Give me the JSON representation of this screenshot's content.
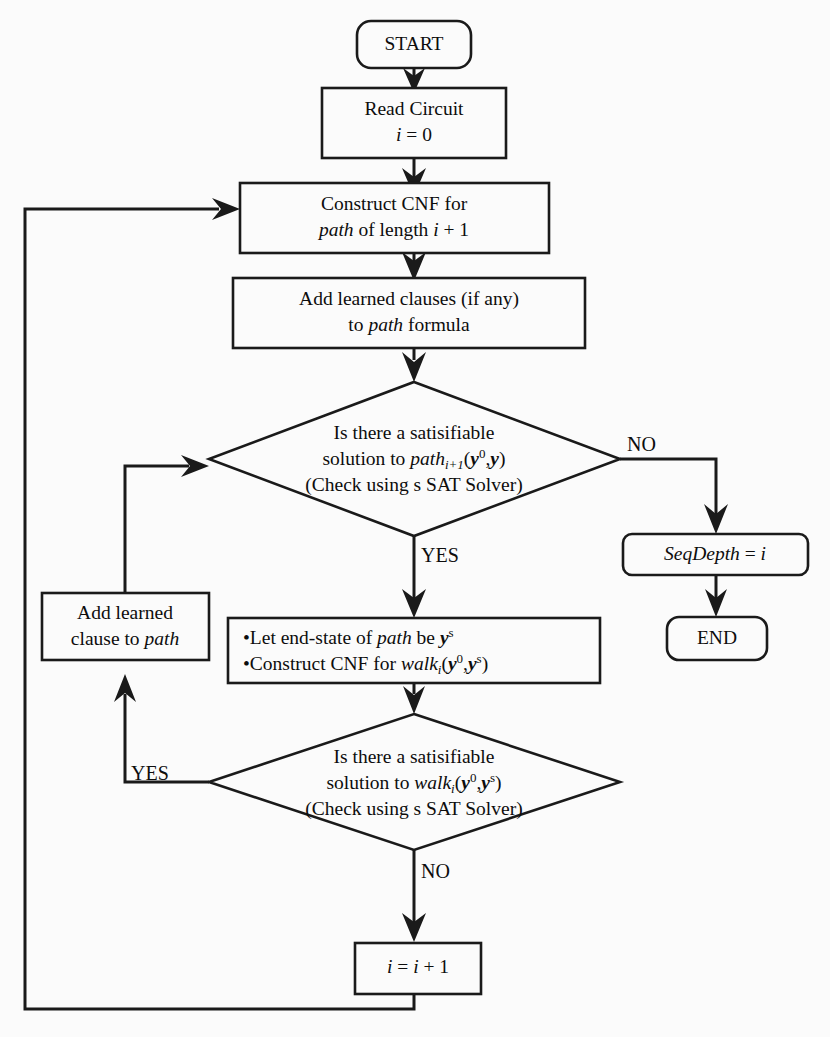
{
  "figure": {
    "type": "flowchart",
    "background_color": "#fbfbfb",
    "line_color": "#1a1a1a"
  },
  "nodes": {
    "start": {
      "id": "start",
      "shape": "rounded-terminator",
      "label": "START"
    },
    "read_circuit": {
      "id": "read-circuit",
      "shape": "rectangle",
      "line1": "Read Circuit",
      "line2_var": "i",
      "line2_rest": " = 0"
    },
    "construct_cnf_path": {
      "id": "construct-cnf-path",
      "shape": "rectangle",
      "line1": "Construct CNF for",
      "line2_a": "path",
      "line2_b": " of length ",
      "line2_c": "i",
      "line2_d": " + 1"
    },
    "add_learned_clauses": {
      "id": "add-learned-clauses",
      "shape": "rectangle",
      "line1": "Add learned clauses (if any)",
      "line2_a": "to ",
      "line2_b": "path",
      "line2_c": " formula"
    },
    "decision_path": {
      "id": "decision-path-sat",
      "shape": "diamond",
      "line1": "Is there a satisifiable",
      "line2_a": "solution to ",
      "line2_b": "path",
      "line2_sub": "i+1",
      "line2_c": "(",
      "line2_y0": "y",
      "line2_y0sup": "0",
      "line2_comma": ",",
      "line2_y": "y",
      "line2_close": ")",
      "line3": "(Check using s SAT Solver)"
    },
    "seq_depth": {
      "id": "seq-depth",
      "shape": "rounded-rectangle",
      "label_a": "SeqDepth",
      "label_b": " = ",
      "label_c": "i"
    },
    "end": {
      "id": "end",
      "shape": "rounded-terminator",
      "label": "END"
    },
    "let_end_state": {
      "id": "let-end-state",
      "shape": "rectangle",
      "bullet1_a": "•Let end-state of ",
      "bullet1_b": "path",
      "bullet1_c": " be ",
      "bullet1_y": "y",
      "bullet1_ysup": "s",
      "bullet2_a": "•Construct CNF for ",
      "bullet2_b": "walk",
      "bullet2_sub": "i",
      "bullet2_open": "(",
      "bullet2_y0": "y",
      "bullet2_y0sup": "0",
      "bullet2_comma": ",",
      "bullet2_ys": "y",
      "bullet2_yssup": "s",
      "bullet2_close": ")"
    },
    "add_learned_clause": {
      "id": "add-learned-clause",
      "shape": "rectangle",
      "line1": "Add learned",
      "line2_a": "clause to ",
      "line2_b": "path"
    },
    "decision_walk": {
      "id": "decision-walk-sat",
      "shape": "diamond",
      "line1": "Is there a satisifiable",
      "line2_a": "solution to ",
      "line2_b": "walk",
      "line2_sub": "i",
      "line2_c": "(",
      "line2_y0": "y",
      "line2_y0sup": "0",
      "line2_comma": ",",
      "line2_ys": "y",
      "line2_yssup": "s",
      "line2_close": ")",
      "line3": "(Check using s SAT Solver)"
    },
    "increment": {
      "id": "increment-i",
      "shape": "rectangle",
      "label_a": "i",
      "label_b": " = ",
      "label_c": "i",
      "label_d": " + 1"
    }
  },
  "edge_labels": {
    "path_no": "NO",
    "path_yes": "YES",
    "walk_yes": "YES",
    "walk_no": "NO"
  }
}
